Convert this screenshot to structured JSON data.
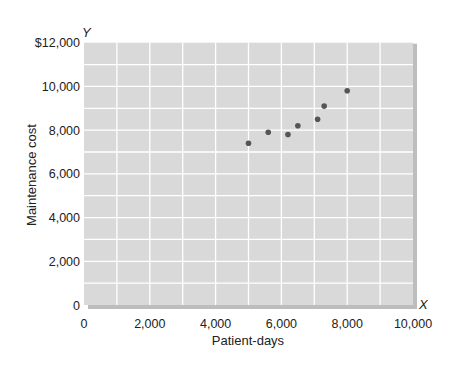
{
  "chart_data": {
    "type": "scatter",
    "title": "",
    "xlabel": "Patient-days",
    "ylabel": "Maintenance cost",
    "x_axis_letter": "X",
    "y_axis_letter": "Y",
    "xlim": [
      0,
      10000
    ],
    "ylim": [
      0,
      12000
    ],
    "grid": true,
    "legend": null,
    "x_ticks": [
      {
        "value": 0,
        "label": "0"
      },
      {
        "value": 2000,
        "label": "2,000"
      },
      {
        "value": 4000,
        "label": "4,000"
      },
      {
        "value": 6000,
        "label": "6,000"
      },
      {
        "value": 8000,
        "label": "8,000"
      },
      {
        "value": 10000,
        "label": "10,000"
      }
    ],
    "y_ticks": [
      {
        "value": 0,
        "label": "0"
      },
      {
        "value": 2000,
        "label": "2,000"
      },
      {
        "value": 4000,
        "label": "4,000"
      },
      {
        "value": 6000,
        "label": "6,000"
      },
      {
        "value": 8000,
        "label": "8,000"
      },
      {
        "value": 10000,
        "label": "10,000"
      },
      {
        "value": 12000,
        "label": "$12,000"
      }
    ],
    "series": [
      {
        "name": "Maintenance cost vs patient-days",
        "points": [
          {
            "x": 5000,
            "y": 7400
          },
          {
            "x": 5600,
            "y": 7900
          },
          {
            "x": 6200,
            "y": 7800
          },
          {
            "x": 6500,
            "y": 8200
          },
          {
            "x": 7100,
            "y": 8500
          },
          {
            "x": 7300,
            "y": 9100
          },
          {
            "x": 8000,
            "y": 9800
          }
        ]
      }
    ]
  },
  "style": {
    "plot_background": "#d9d9d9",
    "gridline_color": "#ffffff",
    "shadow_color": "#bdbdbd",
    "point_color": "#555555"
  }
}
